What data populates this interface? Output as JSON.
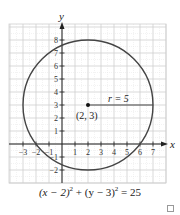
{
  "chart_data": {
    "type": "line",
    "title": "",
    "xlabel": "x",
    "ylabel": "y",
    "xlim": [
      -4,
      8
    ],
    "ylim": [
      -3,
      9
    ],
    "grid": true,
    "x_ticks": [
      "-3",
      "-2",
      "-1",
      "1",
      "2",
      "3",
      "4",
      "5",
      "6",
      "7"
    ],
    "y_ticks": [
      "-2",
      "-1",
      "1",
      "2",
      "3",
      "4",
      "5",
      "6",
      "7",
      "8"
    ],
    "series": [
      {
        "name": "circle",
        "shape": "circle",
        "center": [
          2,
          3
        ],
        "radius": 5
      }
    ],
    "annotations": [
      {
        "text": "(2, 3)",
        "x": 2,
        "y": 3,
        "kind": "point-label"
      },
      {
        "text": "r = 5",
        "x": 4.5,
        "y": 3,
        "kind": "radius-label"
      }
    ],
    "caption": "(x − 2)² + (y − 3)² = 25"
  },
  "labels": {
    "x_axis": "x",
    "y_axis": "y",
    "center": "(2, 3)",
    "radius": "r = 5",
    "eq_a": "(x − 2)",
    "eq_a_exp": "2",
    "eq_b": " + (y − 3)",
    "eq_b_exp": "2",
    "eq_c": " = 25"
  },
  "colors": {
    "curve": "#444444",
    "grid": "#cfcfcf",
    "axis": "#222222"
  }
}
